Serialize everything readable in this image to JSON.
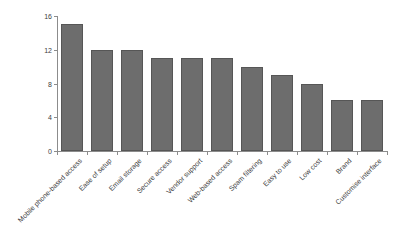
{
  "chart_data": {
    "type": "bar",
    "title": "",
    "xlabel": "",
    "ylabel": "",
    "categories": [
      "Mobile phone-based access",
      "Ease of setup",
      "Email storage",
      "Secure access",
      "Vendor support",
      "Web-based access",
      "Spam filtering",
      "Easy to use",
      "Low cost",
      "Brand",
      "Customise interface"
    ],
    "values": [
      15,
      12,
      12,
      11,
      11,
      11,
      10,
      9,
      8,
      6,
      6
    ],
    "ylim": [
      0,
      16
    ],
    "yticks": [
      0,
      4,
      8,
      12,
      16
    ],
    "grid": false,
    "legend": false,
    "xtick_label_rotation_deg": 45,
    "bar_fill_color": "#6d6d6d",
    "bar_border_color": "#565656",
    "axis_color": "#8c8c8c",
    "tick_label_color": "#404040",
    "background_color": "#ffffff"
  }
}
